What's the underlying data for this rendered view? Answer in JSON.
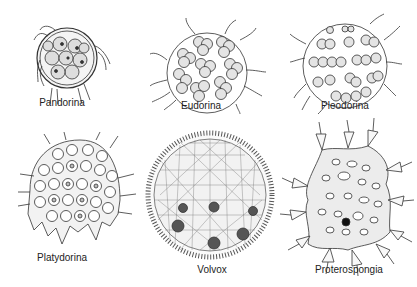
{
  "figure": {
    "background": "#ffffff",
    "ink_color": "#333333",
    "organisms": [
      {
        "name": "Pandorina",
        "label_x": 62,
        "label_y": 107
      },
      {
        "name": "Eudorina",
        "label_x": 201,
        "label_y": 110
      },
      {
        "name": "Pleodorina",
        "label_x": 345,
        "label_y": 110
      },
      {
        "name": "Platydorina",
        "label_x": 62,
        "label_y": 262
      },
      {
        "name": "Volvox",
        "label_x": 212,
        "label_y": 264
      },
      {
        "name": "Proterospongia",
        "label_x": 349,
        "label_y": 264
      }
    ]
  }
}
